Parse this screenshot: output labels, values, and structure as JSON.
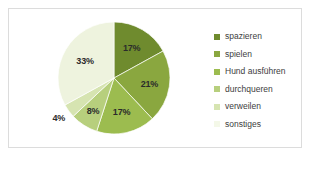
{
  "chart_data": {
    "type": "pie",
    "title": "",
    "subtitle": "",
    "xlabel": "",
    "ylabel": "",
    "grid": false,
    "legend_position": "right",
    "categories": [
      "spazieren",
      "spielen",
      "Hund ausführen",
      "durchqueren",
      "verweilen",
      "sonstiges"
    ],
    "values": [
      17,
      21,
      17,
      8,
      4,
      33
    ],
    "value_labels": [
      "17%",
      "21%",
      "17%",
      "8%",
      "4%",
      "33%"
    ],
    "colors": [
      "#6f8b2e",
      "#8aa73f",
      "#9cbc4f",
      "#b7cf7d",
      "#d6e4b1",
      "#eef3de"
    ],
    "slices": [
      {
        "label": "spazieren",
        "value": 17,
        "display": "17%",
        "color": "#6f8b2e"
      },
      {
        "label": "spielen",
        "value": 21,
        "display": "21%",
        "color": "#8aa73f"
      },
      {
        "label": "Hund ausführen",
        "value": 17,
        "display": "17%",
        "color": "#9cbc4f"
      },
      {
        "label": "durchqueren",
        "value": 8,
        "display": "8%",
        "color": "#b7cf7d"
      },
      {
        "label": "verweilen",
        "value": 4,
        "display": "4%",
        "color": "#d6e4b1"
      },
      {
        "label": "sonstiges",
        "value": 33,
        "display": "33%",
        "color": "#eef3de"
      }
    ]
  },
  "legend": {
    "items": [
      {
        "label": "spazieren",
        "color": "#6f8b2e"
      },
      {
        "label": "spielen",
        "color": "#8aa73f"
      },
      {
        "label": "Hund ausführen",
        "color": "#9cbc4f"
      },
      {
        "label": "durchqueren",
        "color": "#b7cf7d"
      },
      {
        "label": "verweilen",
        "color": "#d6e4b1"
      },
      {
        "label": "sonstiges",
        "color": "#f4f8e8"
      }
    ]
  },
  "style": {
    "frame_border": "#dcdcdc",
    "background": "#ffffff",
    "label_color": "#2b2b2b",
    "legend_text_color": "#3d3d3d"
  }
}
